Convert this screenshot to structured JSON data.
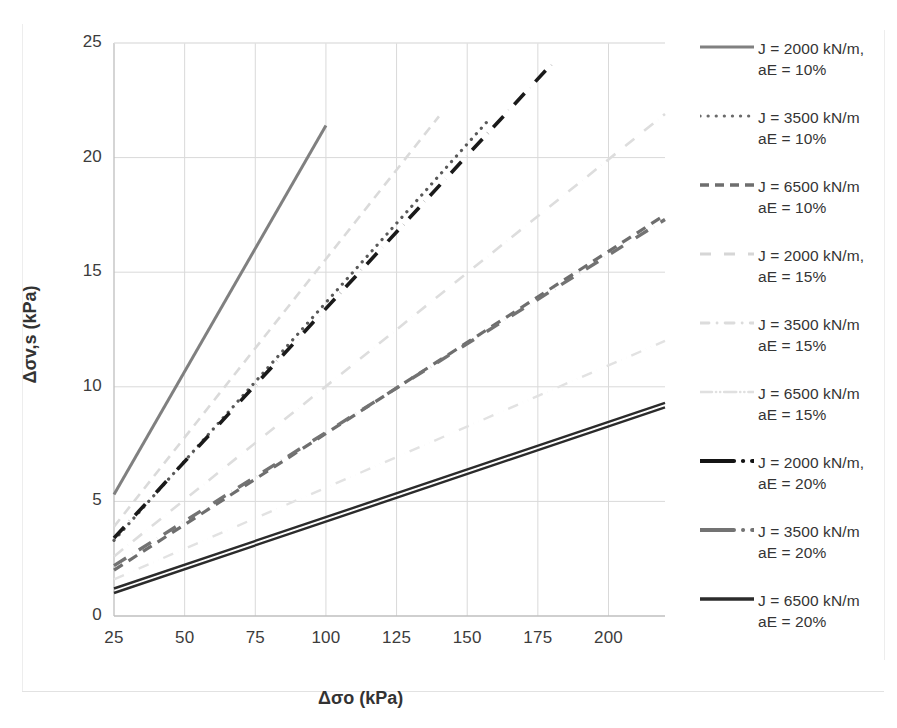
{
  "chart_data": {
    "type": "line",
    "title": "",
    "xlabel": "Δσo (kPa)",
    "ylabel": "Δσv,s (kPa)",
    "xlim": [
      25,
      220
    ],
    "ylim": [
      0,
      25
    ],
    "xticks": [
      25,
      50,
      75,
      100,
      125,
      150,
      175,
      200
    ],
    "yticks": [
      0,
      5,
      10,
      15,
      20,
      25
    ],
    "grid": true,
    "legend_position": "right",
    "x": [
      25,
      220
    ],
    "series": [
      {
        "name": "J = 2000 kN/m, aE = 10%",
        "label_line1": "J = 2000 kN/m,",
        "label_line2": "aE = 10%",
        "style": "solid",
        "color": "#808080",
        "width": 3.0,
        "x_start": 25,
        "x_end": 100,
        "y_start": 5.3,
        "y_end": 21.4
      },
      {
        "name": "J = 3500 kN/m aE = 10%",
        "label_line1": "J = 3500 kN/m",
        "label_line2": "aE = 10%",
        "style": "dotted",
        "color": "#595959",
        "width": 3.2,
        "x_start": 25,
        "x_end": 158,
        "y_start": 3.3,
        "y_end": 21.7
      },
      {
        "name": "J = 6500 kN/m aE = 10%",
        "label_line1": "J = 6500 kN/m",
        "label_line2": "aE = 10%",
        "style": "dashed",
        "color": "#6e6e6e",
        "width": 3.2,
        "x_start": 25,
        "x_end": 220,
        "y_start": 2.0,
        "y_end": 17.5
      },
      {
        "name": "J = 2000 kN/m, aE = 15%",
        "label_line1": "J = 2000 kN/m,",
        "label_line2": "aE = 15%",
        "style": "dashed-faint",
        "color": "#dadada",
        "width": 2.6,
        "x_start": 25,
        "x_end": 140,
        "y_start": 3.9,
        "y_end": 21.8
      },
      {
        "name": "J = 3500 kN/m aE = 15%",
        "label_line1": "J = 3500 kN/m",
        "label_line2": "aE = 15%",
        "style": "dashdot-faint",
        "color": "#dddddd",
        "width": 2.6,
        "x_start": 25,
        "x_end": 220,
        "y_start": 2.6,
        "y_end": 21.9
      },
      {
        "name": "J = 6500 kN/m aE = 15%",
        "label_line1": "J = 6500 kN/m",
        "label_line2": "aE = 15%",
        "style": "dashdotdot-faint",
        "color": "#e2e2e2",
        "width": 2.4,
        "x_start": 25,
        "x_end": 220,
        "y_start": 1.6,
        "y_end": 12.0
      },
      {
        "name": "J = 2000 kN/m, aE = 20%",
        "label_line1": "J = 2000 kN/m,",
        "label_line2": "aE = 20%",
        "style": "dashdot-black",
        "color": "#1a1a1a",
        "width": 3.6,
        "x_start": 25,
        "x_end": 180,
        "y_start": 3.4,
        "y_end": 24.1
      },
      {
        "name": "J = 3500 kN/m aE = 20%",
        "label_line1": "J = 3500 kN/m",
        "label_line2": "aE = 20%",
        "style": "dashdot-gray",
        "color": "#737373",
        "width": 3.4,
        "x_start": 25,
        "x_end": 220,
        "y_start": 2.2,
        "y_end": 17.3
      },
      {
        "name": "J = 6500 kN/m aE = 20%",
        "label_line1": "J = 6500 kN/m",
        "label_line2": "aE = 20%",
        "style": "solid-double-dark",
        "color": "#2b2b2b",
        "width": 2.4,
        "x_start": 25,
        "x_end": 220,
        "y_start": 1.2,
        "y_end": 9.3
      }
    ]
  },
  "axes": {
    "x_title": "Δσo (kPa)",
    "y_title": "Δσv,s (kPa)",
    "x_tick_labels": [
      "25",
      "50",
      "75",
      "100",
      "125",
      "150",
      "175",
      "200"
    ],
    "y_tick_labels": [
      "0",
      "5",
      "10",
      "15",
      "20",
      "25"
    ]
  },
  "legend": {
    "entries": [
      {
        "line1": "J = 2000 kN/m,",
        "line2": "aE = 10%",
        "swatch": "solid-gray"
      },
      {
        "line1": "J = 3500 kN/m",
        "line2": "aE = 10%",
        "swatch": "dotted-gray"
      },
      {
        "line1": "J = 6500 kN/m",
        "line2": "aE = 10%",
        "swatch": "dashed-gray"
      },
      {
        "line1": "J = 2000 kN/m,",
        "line2": "aE = 15%",
        "swatch": "dashed-faint"
      },
      {
        "line1": "J = 3500 kN/m",
        "line2": "aE = 15%",
        "swatch": "dashdot-faint"
      },
      {
        "line1": "J = 6500 kN/m",
        "line2": "aE = 15%",
        "swatch": "dashdotdot-faint"
      },
      {
        "line1": "J = 2000 kN/m,",
        "line2": "aE = 20%",
        "swatch": "dashdot-black"
      },
      {
        "line1": "J = 3500 kN/m",
        "line2": "aE = 20%",
        "swatch": "dashdot-gray"
      },
      {
        "line1": "J = 6500 kN/m",
        "line2": "aE = 20%",
        "swatch": "solid-dark"
      }
    ]
  },
  "colors": {
    "gridline": "#d9d9d9",
    "axis": "#bfbfbf",
    "text": "#3a3a3a",
    "background": "#ffffff"
  }
}
